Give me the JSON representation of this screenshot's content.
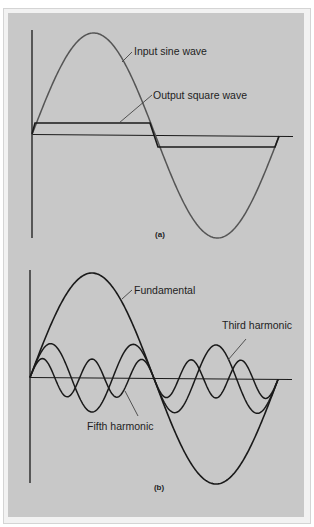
{
  "figure_a": {
    "caption": "(a)",
    "labels": {
      "input": "Input sine wave",
      "output": "Output square wave"
    }
  },
  "figure_b": {
    "caption": "(b)",
    "labels": {
      "fundamental": "Fundamental",
      "third": "Third harmonic",
      "fifth": "Fifth harmonic"
    }
  },
  "colors": {
    "panel_background": "#c8c8c8",
    "sine_wave": "#555555",
    "square_wave": "#1a1a1a",
    "axes": "#1a1a1a"
  }
}
